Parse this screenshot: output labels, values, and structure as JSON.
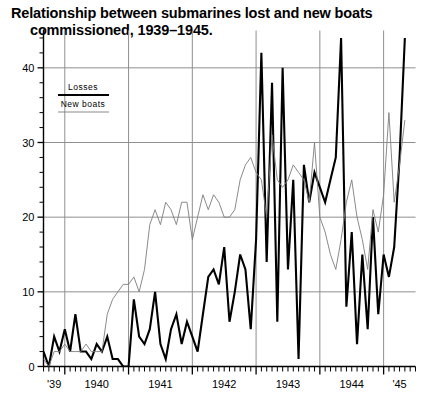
{
  "chart_data": {
    "type": "line",
    "title": "Relationship between submarines lost and new boats commissioned, 1939–1945.",
    "title_line1": "Relationship between submarines lost and new boats",
    "title_line2": "commissioned, 1939–1945.",
    "xlabel": "",
    "ylabel": "",
    "grid": true,
    "grid_axes": "both",
    "legend_position": "inside-top-left",
    "xlim": [
      1939.666,
      1945.5
    ],
    "ylim": [
      0,
      45
    ],
    "yticks": [
      0,
      10,
      20,
      30,
      40
    ],
    "ytick_labels": [
      "0",
      "10",
      "20",
      "30",
      "40"
    ],
    "y_minor_tick_step": 2,
    "xticks": [
      1939,
      1940,
      1941,
      1942,
      1943,
      1944,
      1945
    ],
    "xtick_labels": [
      "'39",
      "1940",
      "1941",
      "1942",
      "1943",
      "1944",
      "'45"
    ],
    "x_minor_tick_step": 0.0833,
    "x_minor_tick_unit": "month",
    "series": [
      {
        "name": "Losses",
        "style": "thick-black-line",
        "color": "#000000",
        "line_width": 2.1,
        "x": [
          1939.666,
          1939.75,
          1939.833,
          1939.916,
          1940.0,
          1940.083,
          1940.166,
          1940.25,
          1940.333,
          1940.416,
          1940.5,
          1940.583,
          1940.666,
          1940.75,
          1940.833,
          1940.916,
          1941.0,
          1941.083,
          1941.166,
          1941.25,
          1941.333,
          1941.416,
          1941.5,
          1941.583,
          1941.666,
          1941.75,
          1941.833,
          1941.916,
          1942.0,
          1942.083,
          1942.166,
          1942.25,
          1942.333,
          1942.416,
          1942.5,
          1942.583,
          1942.666,
          1942.75,
          1942.833,
          1942.916,
          1943.0,
          1943.083,
          1943.166,
          1943.25,
          1943.333,
          1943.416,
          1943.5,
          1943.583,
          1943.666,
          1943.75,
          1943.833,
          1943.916,
          1944.0,
          1944.083,
          1944.166,
          1944.25,
          1944.333,
          1944.416,
          1944.5,
          1944.583,
          1944.666,
          1944.75,
          1944.833,
          1944.916,
          1945.0,
          1945.083,
          1945.166,
          1945.25,
          1945.333
        ],
        "values": [
          2,
          0,
          4,
          2,
          5,
          2,
          7,
          2,
          2,
          1,
          3,
          2,
          4,
          1,
          1,
          0,
          0,
          9,
          4,
          3,
          5,
          10,
          3,
          1,
          5,
          7,
          3,
          6,
          4,
          2,
          7,
          12,
          13,
          11,
          16,
          6,
          10,
          15,
          13,
          5,
          17,
          42,
          14,
          38,
          6,
          40,
          13,
          25,
          1,
          27,
          22,
          26,
          24,
          22,
          25,
          28,
          44,
          8,
          18,
          3,
          15,
          5,
          20,
          7,
          15,
          12,
          16,
          28,
          44
        ]
      },
      {
        "name": "New boats",
        "style": "thin-black-line",
        "color": "#808080",
        "line_width": 0.9,
        "x": [
          1939.666,
          1939.75,
          1939.833,
          1939.916,
          1940.0,
          1940.083,
          1940.166,
          1940.25,
          1940.333,
          1940.416,
          1940.5,
          1940.583,
          1940.666,
          1940.75,
          1940.833,
          1940.916,
          1941.0,
          1941.083,
          1941.166,
          1941.25,
          1941.333,
          1941.416,
          1941.5,
          1941.583,
          1941.666,
          1941.75,
          1941.833,
          1941.916,
          1942.0,
          1942.083,
          1942.166,
          1942.25,
          1942.333,
          1942.416,
          1942.5,
          1942.583,
          1942.666,
          1942.75,
          1942.833,
          1942.916,
          1943.0,
          1943.083,
          1943.166,
          1943.25,
          1943.333,
          1943.416,
          1943.5,
          1943.583,
          1943.666,
          1943.75,
          1943.833,
          1943.916,
          1944.0,
          1944.083,
          1944.166,
          1944.25,
          1944.333,
          1944.416,
          1944.5,
          1944.583,
          1944.666,
          1944.75,
          1944.833,
          1944.916,
          1945.0,
          1945.083,
          1945.166,
          1945.25,
          1945.333
        ],
        "values": [
          1,
          0,
          2,
          2,
          3,
          2,
          2,
          2,
          3,
          2,
          2,
          2,
          7,
          9,
          10,
          11,
          11,
          12,
          10,
          13,
          19,
          21,
          19,
          22,
          21,
          19,
          22,
          22,
          17,
          20,
          23,
          21,
          23,
          22,
          20,
          20,
          21,
          25,
          27,
          28,
          26,
          25,
          20,
          31,
          25,
          24,
          25,
          27,
          26,
          25,
          22,
          30,
          20,
          18,
          15,
          13,
          17,
          22,
          25,
          20,
          17,
          13,
          21,
          18,
          23,
          34,
          22,
          27,
          33
        ]
      }
    ],
    "legend_entries": [
      {
        "label": "Losses",
        "style": "thick"
      },
      {
        "label": "New boats",
        "style": "thin"
      }
    ]
  },
  "axes": {
    "ytick_labels": [
      "0",
      "10",
      "20",
      "30",
      "40"
    ],
    "xtick_labels": [
      "'39",
      "1940",
      "1941",
      "1942",
      "1943",
      "1944",
      "'45"
    ]
  },
  "legend": {
    "losses_label": "Losses",
    "new_boats_label": "New boats"
  },
  "colors": {
    "background": "#ffffff",
    "axis": "#000000",
    "grid": "#8f8f8f",
    "losses_line": "#000000",
    "new_boats_line": "#7d7d7d"
  }
}
